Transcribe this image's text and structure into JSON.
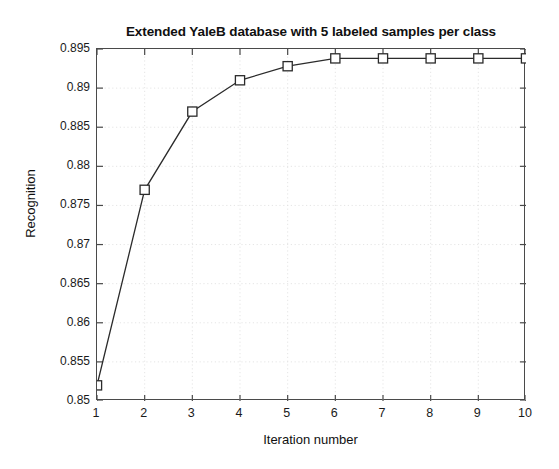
{
  "chart_data": {
    "type": "line",
    "title": "Extended YaleB database with 5 labeled samples per class",
    "xlabel": "Iteration number",
    "ylabel": "Recognition",
    "x": [
      1,
      2,
      3,
      4,
      5,
      6,
      7,
      8,
      9,
      10
    ],
    "values": [
      0.852,
      0.877,
      0.887,
      0.891,
      0.8928,
      0.8938,
      0.8938,
      0.8938,
      0.8938,
      0.8938
    ],
    "series": [
      {
        "name": "Recognition",
        "values": [
          0.852,
          0.877,
          0.887,
          0.891,
          0.8928,
          0.8938,
          0.8938,
          0.8938,
          0.8938,
          0.8938
        ],
        "marker": "square-open",
        "line_color": "#2b2b2b"
      }
    ],
    "xlim": [
      1,
      10
    ],
    "ylim": [
      0.85,
      0.895
    ],
    "xticks": [
      1,
      2,
      3,
      4,
      5,
      6,
      7,
      8,
      9,
      10
    ],
    "xtick_labels": [
      "1",
      "2",
      "3",
      "4",
      "5",
      "6",
      "7",
      "8",
      "9",
      "10"
    ],
    "yticks": [
      0.85,
      0.855,
      0.86,
      0.865,
      0.87,
      0.875,
      0.88,
      0.885,
      0.89,
      0.895
    ],
    "ytick_labels": [
      "0.85",
      "0.855",
      "0.86",
      "0.865",
      "0.87",
      "0.875",
      "0.88",
      "0.885",
      "0.89",
      "0.895"
    ],
    "grid": true,
    "grid_style": "dotted",
    "grid_color": "#e2e2e2",
    "legend": null,
    "legend_position": "none",
    "background": "#ffffff",
    "axis_color": "#4a4a4a"
  }
}
